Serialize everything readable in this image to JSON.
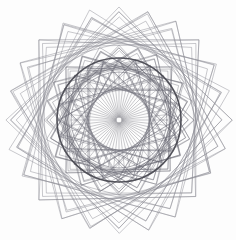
{
  "canvas": {
    "width": 236,
    "height": 240,
    "background_color": "#fdfdfd",
    "title": "geometric-rosette-spirograph"
  },
  "chart_data": {
    "type": "scatter",
    "title": "",
    "subtitle": "",
    "xlabel": "",
    "ylabel": "",
    "grid": false,
    "legend": null,
    "center": {
      "x": 119,
      "y": 120
    },
    "layers": [
      {
        "name": "outer-star-polygons",
        "shape": "rotated-quadrilateral",
        "count": 24,
        "rotation_step_deg": 15,
        "circumradius": 108,
        "stroke": "#8a8a92",
        "stroke_width": 0.55,
        "opacity": 0.85
      },
      {
        "name": "mid-web-polygons",
        "shape": "rotated-quadrilateral",
        "count": 24,
        "rotation_step_deg": 15,
        "circumradius": 72,
        "stroke": "#6f6f78",
        "stroke_width": 0.5,
        "opacity": 0.8
      },
      {
        "name": "inner-web-polygons",
        "shape": "rotated-triangle",
        "count": 24,
        "rotation_step_deg": 15,
        "circumradius": 60,
        "stroke": "#5e5e68",
        "stroke_width": 0.45,
        "opacity": 0.75
      },
      {
        "name": "heavy-ring",
        "shape": "circle",
        "radius": 62,
        "stroke": "#4a4a52",
        "stroke_width": 1.6,
        "opacity": 0.95
      },
      {
        "name": "inner-ring",
        "shape": "circle",
        "radius": 48,
        "stroke": "#70707a",
        "stroke_width": 0.7,
        "opacity": 0.8
      },
      {
        "name": "radial-spokes",
        "shape": "line",
        "count": 56,
        "inner_radius": 3,
        "outer_radius": 48,
        "stroke": "#75757f",
        "stroke_width": 0.45,
        "opacity": 0.85
      },
      {
        "name": "center-dot",
        "shape": "filled-circle",
        "radius": 3.2,
        "fill": "#2b2b30"
      }
    ],
    "axis_ranges": {
      "x": [
        0,
        236
      ],
      "y": [
        0,
        240
      ]
    },
    "colors": {
      "background": "#fdfdfd",
      "light_line": "#8a8a92",
      "mid_line": "#6f6f78",
      "dark_line": "#4a4a52",
      "center_dot": "#2b2b30"
    }
  }
}
